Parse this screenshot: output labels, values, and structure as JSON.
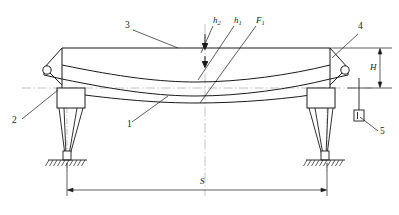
{
  "diagram": {
    "type": "engineering-line-drawing",
    "line_color": "#1a1a1a",
    "background": "#ffffff",
    "centerline_color": "#8a8a8a"
  },
  "labels": {
    "item1": "1",
    "item2": "2",
    "item3": "3",
    "item4": "4",
    "item5": "5",
    "h2": "h",
    "h2_sub": "2",
    "h1": "h",
    "h1_sub": "1",
    "F1": "F",
    "F1_sub": "1",
    "H": "H",
    "S": "S"
  },
  "callouts": [
    {
      "name": "callout-3",
      "label": "3",
      "points_to": "top-chord"
    },
    {
      "name": "callout-1",
      "label": "1",
      "points_to": "lower-chord"
    },
    {
      "name": "callout-2",
      "label": "2",
      "points_to": "left-pin-bearing"
    },
    {
      "name": "callout-4",
      "label": "4",
      "points_to": "right-pin-bearing"
    },
    {
      "name": "callout-5",
      "label": "5",
      "points_to": "side-block"
    }
  ],
  "dimensions": [
    {
      "name": "height-dimension",
      "label": "H",
      "orientation": "vertical",
      "position": "right"
    },
    {
      "name": "span-dimension",
      "label": "S",
      "orientation": "horizontal",
      "position": "bottom"
    },
    {
      "name": "h2-dimension",
      "label": "h2",
      "orientation": "vertical",
      "position": "center"
    },
    {
      "name": "h1-dimension",
      "label": "h1",
      "orientation": "vertical",
      "position": "center"
    },
    {
      "name": "F1-load",
      "label": "F1",
      "orientation": "vertical",
      "position": "center"
    }
  ]
}
